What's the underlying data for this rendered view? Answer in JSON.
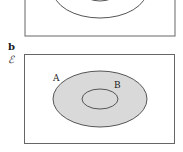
{
  "panels": [
    {
      "label": "",
      "universal": "",
      "sets": []
    },
    {
      "label": "b",
      "universal": "ℰ",
      "sets": [
        {
          "name": "A",
          "shaded": true
        },
        {
          "name": "B",
          "shaded": true,
          "subset_of": "A"
        }
      ]
    }
  ],
  "colors": {
    "line": "#555555",
    "shade": "#d9d9d9",
    "text": "#222222"
  }
}
